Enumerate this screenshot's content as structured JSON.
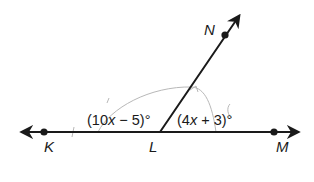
{
  "diagram": {
    "type": "geometry-angles",
    "points": {
      "K": {
        "label": "K"
      },
      "L": {
        "label": "L"
      },
      "M": {
        "label": "M"
      },
      "N": {
        "label": "N"
      }
    },
    "angles": {
      "KLN": {
        "label_pre": "(10",
        "var": "x",
        "label_post": " − 5)°"
      },
      "NLM": {
        "label_pre": "(4",
        "var": "x",
        "label_post": " + 3)°"
      }
    },
    "colors": {
      "ink": "#1a1a1a",
      "pencil_marks": "#b8b8b8",
      "background": "#ffffff"
    }
  }
}
